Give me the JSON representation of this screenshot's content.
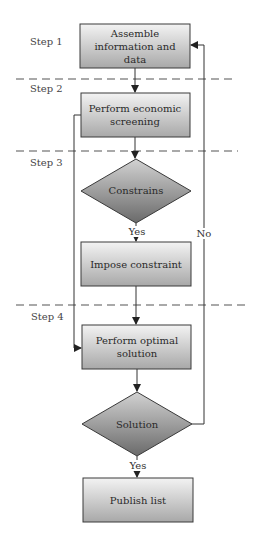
{
  "steps": [
    {
      "label": "Step 1",
      "y": 45
    },
    {
      "label": "Step 2",
      "y": 91
    },
    {
      "label": "Step 3",
      "y": 164
    },
    {
      "label": "Step 4",
      "y": 318
    }
  ],
  "dividers": [
    {
      "y": 79,
      "x1": 16,
      "x2": 236
    },
    {
      "y": 151,
      "x1": 16,
      "x2": 238
    },
    {
      "y": 305,
      "x1": 16,
      "x2": 247
    }
  ],
  "nodes": {
    "assemble": {
      "type": "process",
      "lines": [
        "Assemble",
        "information and",
        "data"
      ]
    },
    "screening": {
      "type": "process",
      "lines": [
        "Perform economic",
        "screening"
      ]
    },
    "constrains": {
      "type": "decision",
      "lines": [
        "Constrains"
      ]
    },
    "impose": {
      "type": "process",
      "lines": [
        "Impose constraint"
      ]
    },
    "optimal": {
      "type": "process",
      "lines": [
        "Perform optimal",
        "solution"
      ]
    },
    "solution": {
      "type": "decision",
      "lines": [
        "Solution"
      ]
    },
    "publish": {
      "type": "process",
      "lines": [
        "Publish list"
      ]
    }
  },
  "edge_labels": {
    "constrains_yes": "Yes",
    "solution_yes": "Yes",
    "solution_no": "No"
  },
  "colors": {
    "box_top": "#f2f2f2",
    "box_bottom": "#a9a9a9",
    "diamond_top": "#cfcfcf",
    "diamond_bottom": "#6e6e6e",
    "stroke": "#3a3a3a",
    "dash": "#555555"
  }
}
